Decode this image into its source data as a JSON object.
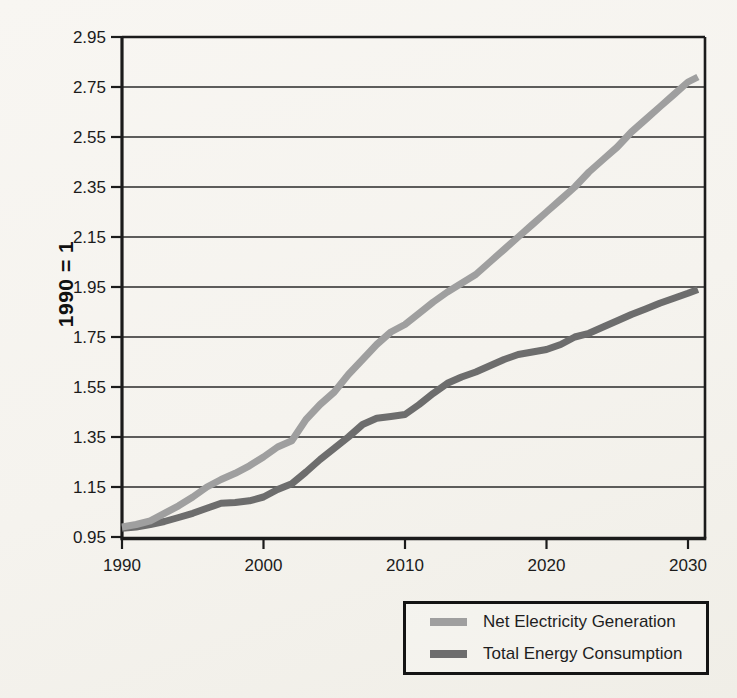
{
  "page": {
    "background_color": "#f6f4ef"
  },
  "chart_data": {
    "type": "line",
    "title": "",
    "xlabel": "",
    "ylabel": "1990 = 1",
    "x_ticks": [
      "1990",
      "2000",
      "2010",
      "2020",
      "2030"
    ],
    "y_ticks": [
      "2.95",
      "2.75",
      "2.55",
      "2.35",
      "2.15",
      "1.95",
      "1.75",
      "1.55",
      "1.35",
      "1.15",
      "0.95"
    ],
    "xlim": [
      1990,
      2031.2
    ],
    "ylim": [
      0.95,
      2.95
    ],
    "grid": "horizontal-only",
    "legend_position": "below-plot-right",
    "axis_color": "#1b1b1b",
    "gridline_color": "#2a2a2a",
    "series": [
      {
        "name": "Net Electricity Generation",
        "color": "#9f9f9f",
        "points": [
          [
            1990,
            0.99
          ],
          [
            1991,
            1.0
          ],
          [
            1992,
            1.015
          ],
          [
            1993,
            1.045
          ],
          [
            1994,
            1.075
          ],
          [
            1995,
            1.11
          ],
          [
            1996,
            1.15
          ],
          [
            1997,
            1.18
          ],
          [
            1998,
            1.205
          ],
          [
            1999,
            1.235
          ],
          [
            2000,
            1.27
          ],
          [
            2001,
            1.31
          ],
          [
            2002,
            1.335
          ],
          [
            2003,
            1.42
          ],
          [
            2004,
            1.48
          ],
          [
            2005,
            1.53
          ],
          [
            2006,
            1.6
          ],
          [
            2007,
            1.66
          ],
          [
            2008,
            1.72
          ],
          [
            2009,
            1.77
          ],
          [
            2010,
            1.8
          ],
          [
            2011,
            1.845
          ],
          [
            2012,
            1.89
          ],
          [
            2013,
            1.93
          ],
          [
            2014,
            1.965
          ],
          [
            2015,
            2.0
          ],
          [
            2016,
            2.05
          ],
          [
            2017,
            2.1
          ],
          [
            2018,
            2.15
          ],
          [
            2019,
            2.2
          ],
          [
            2020,
            2.25
          ],
          [
            2021,
            2.3
          ],
          [
            2022,
            2.35
          ],
          [
            2023,
            2.41
          ],
          [
            2024,
            2.46
          ],
          [
            2025,
            2.51
          ],
          [
            2026,
            2.57
          ],
          [
            2027,
            2.62
          ],
          [
            2028,
            2.67
          ],
          [
            2029,
            2.72
          ],
          [
            2030,
            2.77
          ],
          [
            2030.7,
            2.79
          ]
        ]
      },
      {
        "name": "Total Energy Consumption",
        "color": "#6d6d6d",
        "points": [
          [
            1990,
            0.985
          ],
          [
            1991,
            0.99
          ],
          [
            1992,
            1.0
          ],
          [
            1993,
            1.012
          ],
          [
            1994,
            1.028
          ],
          [
            1995,
            1.045
          ],
          [
            1996,
            1.065
          ],
          [
            1997,
            1.085
          ],
          [
            1998,
            1.088
          ],
          [
            1999,
            1.095
          ],
          [
            2000,
            1.11
          ],
          [
            2001,
            1.14
          ],
          [
            2002,
            1.163
          ],
          [
            2003,
            1.21
          ],
          [
            2004,
            1.26
          ],
          [
            2005,
            1.305
          ],
          [
            2006,
            1.35
          ],
          [
            2007,
            1.4
          ],
          [
            2008,
            1.425
          ],
          [
            2009,
            1.432
          ],
          [
            2010,
            1.44
          ],
          [
            2011,
            1.48
          ],
          [
            2012,
            1.525
          ],
          [
            2013,
            1.565
          ],
          [
            2014,
            1.59
          ],
          [
            2015,
            1.61
          ],
          [
            2016,
            1.635
          ],
          [
            2017,
            1.66
          ],
          [
            2018,
            1.68
          ],
          [
            2019,
            1.69
          ],
          [
            2020,
            1.7
          ],
          [
            2021,
            1.72
          ],
          [
            2022,
            1.75
          ],
          [
            2023,
            1.765
          ],
          [
            2024,
            1.79
          ],
          [
            2025,
            1.815
          ],
          [
            2026,
            1.84
          ],
          [
            2027,
            1.862
          ],
          [
            2028,
            1.885
          ],
          [
            2029,
            1.905
          ],
          [
            2030,
            1.925
          ],
          [
            2030.7,
            1.94
          ]
        ]
      }
    ]
  }
}
